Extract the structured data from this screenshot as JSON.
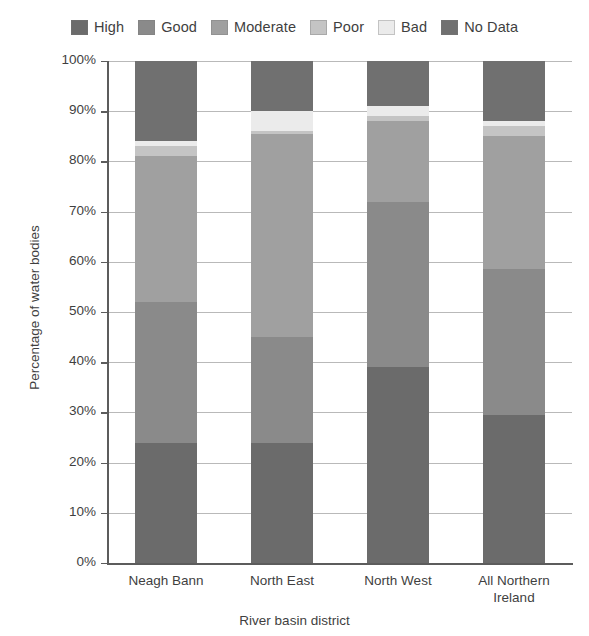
{
  "legend": {
    "position": "top",
    "items": [
      {
        "label": "High",
        "color": "#6b6b6b"
      },
      {
        "label": "Good",
        "color": "#8a8a8a"
      },
      {
        "label": "Moderate",
        "color": "#a0a0a0"
      },
      {
        "label": "Poor",
        "color": "#c4c4c4"
      },
      {
        "label": "Bad",
        "color": "#ebebeb"
      },
      {
        "label": "No Data",
        "color": "#707070"
      }
    ]
  },
  "axes": {
    "ylabel": "Percentage of water bodies",
    "xlabel": "River basin district",
    "yticks": [
      "0%",
      "10%",
      "20%",
      "30%",
      "40%",
      "50%",
      "60%",
      "70%",
      "80%",
      "90%",
      "100%"
    ],
    "xticks": [
      "Neagh Bann",
      "North East",
      "North West",
      "All Northern Ireland"
    ]
  },
  "chart_data": {
    "type": "bar",
    "subtype": "stacked-percentage",
    "title": "",
    "xlabel": "River basin district",
    "ylabel": "Percentage of water bodies",
    "ylim": [
      0,
      100
    ],
    "yticks": [
      0,
      10,
      20,
      30,
      40,
      50,
      60,
      70,
      80,
      90,
      100
    ],
    "ytick_labels": [
      "0%",
      "10%",
      "20%",
      "30%",
      "40%",
      "50%",
      "60%",
      "70%",
      "80%",
      "90%",
      "100%"
    ],
    "grid": true,
    "grid_axis": "y",
    "legend_position": "top",
    "categories": [
      "Neagh Bann",
      "North East",
      "North West",
      "All Northern Ireland"
    ],
    "series": [
      {
        "name": "High",
        "color": "#6b6b6b",
        "values": [
          24,
          24,
          39,
          29.5
        ]
      },
      {
        "name": "Good",
        "color": "#8a8a8a",
        "values": [
          28,
          21,
          33,
          29
        ]
      },
      {
        "name": "Moderate",
        "color": "#a0a0a0",
        "values": [
          29,
          40.5,
          16,
          26.5
        ]
      },
      {
        "name": "Poor",
        "color": "#c4c4c4",
        "values": [
          2,
          0.5,
          1,
          2
        ]
      },
      {
        "name": "Bad",
        "color": "#ebebeb",
        "values": [
          1,
          4,
          2,
          1
        ]
      },
      {
        "name": "No Data",
        "color": "#707070",
        "values": [
          16,
          10,
          9,
          12
        ]
      }
    ],
    "cumulative_tops": {
      "Neagh Bann": {
        "High": 24,
        "Good": 52,
        "Moderate": 81,
        "Poor": 83,
        "Bad": 84,
        "No Data": 100
      },
      "North East": {
        "High": 24,
        "Good": 45,
        "Moderate": 85.5,
        "Poor": 86,
        "Bad": 90,
        "No Data": 100
      },
      "North West": {
        "High": 39,
        "Good": 72,
        "Moderate": 88,
        "Poor": 89,
        "Bad": 91,
        "No Data": 100
      },
      "All Northern Ireland": {
        "High": 29.5,
        "Good": 58.5,
        "Moderate": 85,
        "Poor": 87,
        "Bad": 88,
        "No Data": 100
      }
    }
  }
}
